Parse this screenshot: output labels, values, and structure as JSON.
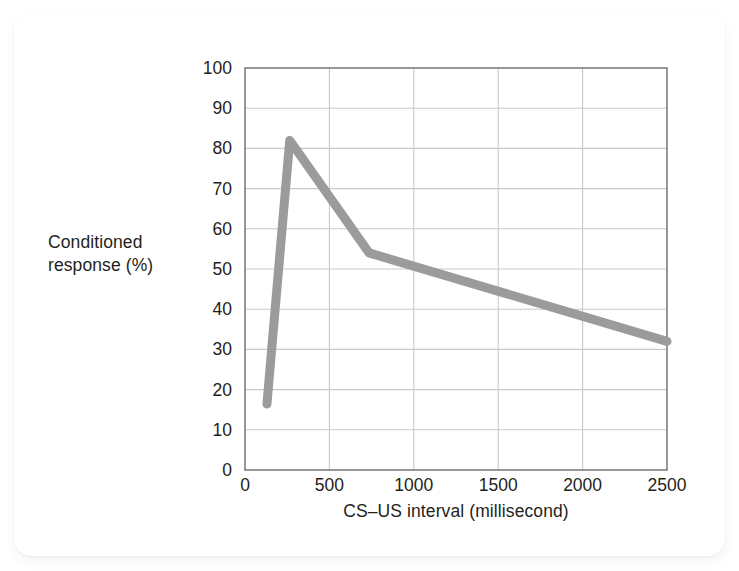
{
  "chart_data": {
    "type": "line",
    "title": "",
    "xlabel": "CS–US interval (millisecond)",
    "ylabel": "Conditioned response (%)",
    "ylabel_lines": [
      "Conditioned",
      "response (%)"
    ],
    "xlim": [
      0,
      2500
    ],
    "ylim": [
      0,
      100
    ],
    "xticks": [
      0,
      500,
      1000,
      1500,
      2000,
      2500
    ],
    "xtick_labels": [
      "0",
      "500",
      "1000",
      "1500",
      "2000",
      "2500"
    ],
    "yticks": [
      0,
      10,
      20,
      30,
      40,
      50,
      60,
      70,
      80,
      90,
      100
    ],
    "ytick_labels": [
      "0",
      "10",
      "20",
      "30",
      "40",
      "50",
      "60",
      "70",
      "80",
      "90",
      "100"
    ],
    "grid": true,
    "grid_x": true,
    "grid_y": true,
    "legend": false,
    "legend_position": "none",
    "series": [
      {
        "name": "Conditioned response",
        "color": "#9b9b9b",
        "line_width": 9,
        "x": [
          130,
          265,
          735,
          2500
        ],
        "y": [
          16.4,
          82,
          54,
          32
        ],
        "points": [
          {
            "x": 130,
            "y": 16.4
          },
          {
            "x": 265,
            "y": 82
          },
          {
            "x": 735,
            "y": 54
          },
          {
            "x": 2500,
            "y": 32
          }
        ]
      }
    ]
  },
  "style": {
    "line_color": "#9b9b9b",
    "grid_color": "#c9c9c9",
    "axis_color": "#6e6e6e",
    "text_color": "#231f20",
    "card_background": "#ffffff",
    "page_background": "#ffffff"
  }
}
